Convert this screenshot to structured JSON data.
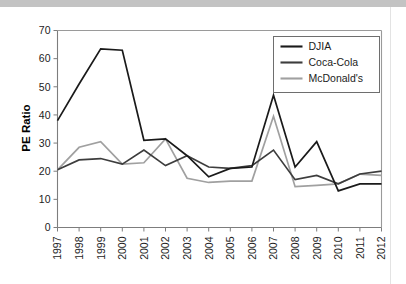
{
  "figure": {
    "background_color": "#ffffff",
    "top_band_color": "#c3c3c3",
    "axis_color": "#7d7d7d"
  },
  "chart_data": {
    "type": "line",
    "title": "",
    "xlabel": "",
    "ylabel": "PE Ratio",
    "ylim": [
      0,
      70
    ],
    "ytick_step": 10,
    "yticks": [
      0,
      10,
      20,
      30,
      40,
      50,
      60,
      70
    ],
    "grid": false,
    "legend_position": "top-right-inside",
    "categories": [
      "1997",
      "1998",
      "1999",
      "2000",
      "2001",
      "2002",
      "2003",
      "2004",
      "2005",
      "2006",
      "2007",
      "2008",
      "2009",
      "2010",
      "2011",
      "2012"
    ],
    "x": [
      1997,
      1998,
      1999,
      2000,
      2001,
      2002,
      2003,
      2004,
      2005,
      2006,
      2007,
      2008,
      2009,
      2010,
      2011,
      2012
    ],
    "series": [
      {
        "name": "DJIA",
        "color": "#1a1a1a",
        "values": [
          38.0,
          51.0,
          63.5,
          63.0,
          31.0,
          31.5,
          25.5,
          18.0,
          21.0,
          21.5,
          47.0,
          21.5,
          30.5,
          13.0,
          15.5,
          15.5
        ]
      },
      {
        "name": "Coca-Cola",
        "color": "#3d3d3d",
        "values": [
          20.5,
          24.0,
          24.5,
          22.5,
          27.5,
          22.0,
          25.5,
          21.5,
          21.0,
          22.0,
          27.5,
          17.0,
          18.5,
          15.5,
          19.0,
          20.0
        ]
      },
      {
        "name": "McDonald's",
        "color": "#a0a0a0",
        "values": [
          20.5,
          28.5,
          30.5,
          22.5,
          23.0,
          31.5,
          17.5,
          16.0,
          16.5,
          16.5,
          39.5,
          14.5,
          15.0,
          15.5,
          19.0,
          18.5
        ]
      }
    ]
  },
  "legend": {
    "entries": [
      {
        "label": "DJIA",
        "color": "#1a1a1a"
      },
      {
        "label": "Coca-Cola",
        "color": "#3d3d3d"
      },
      {
        "label": "McDonald's",
        "color": "#a0a0a0"
      }
    ]
  }
}
